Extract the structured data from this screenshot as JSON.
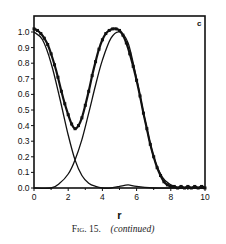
{
  "chart_data": {
    "type": "line",
    "panel_label": "c",
    "xlabel": "r",
    "ylabel": "",
    "xlim": [
      0,
      10
    ],
    "ylim": [
      0,
      1.1
    ],
    "xticks": [
      "0",
      "2",
      "4",
      "6",
      "8",
      "10"
    ],
    "yticks": [
      "0.0",
      "0.1",
      "0.2",
      "0.3",
      "0.4",
      "0.5",
      "0.6",
      "0.7",
      "0.8",
      "0.9",
      "1.0"
    ],
    "grid": false,
    "legend": null,
    "series": [
      {
        "name": "total (with markers)",
        "style": "line-markers",
        "x": [
          0,
          0.2,
          0.4,
          0.6,
          0.8,
          1.0,
          1.2,
          1.4,
          1.6,
          1.8,
          2.0,
          2.2,
          2.4,
          2.6,
          2.8,
          3.0,
          3.2,
          3.4,
          3.6,
          3.8,
          4.0,
          4.2,
          4.4,
          4.6,
          4.8,
          5.0,
          5.2,
          5.4,
          5.6,
          5.8,
          6.0,
          6.2,
          6.4,
          6.6,
          6.8,
          7.0,
          7.2,
          7.4,
          7.6,
          7.8,
          8.0,
          8.2,
          8.4,
          8.6,
          8.8,
          9.0,
          9.2,
          9.4,
          9.6,
          9.8,
          10.0
        ],
        "y": [
          1.02,
          1.01,
          0.99,
          0.96,
          0.92,
          0.86,
          0.79,
          0.71,
          0.62,
          0.54,
          0.47,
          0.41,
          0.38,
          0.4,
          0.45,
          0.53,
          0.62,
          0.72,
          0.81,
          0.89,
          0.95,
          0.99,
          1.01,
          1.02,
          1.02,
          1.01,
          0.98,
          0.93,
          0.86,
          0.78,
          0.69,
          0.59,
          0.48,
          0.38,
          0.28,
          0.2,
          0.13,
          0.08,
          0.04,
          0.02,
          0.01,
          0.01,
          0.0,
          0.01,
          0.0,
          0.01,
          0.0,
          0.01,
          0.0,
          0.01,
          0.0
        ]
      },
      {
        "name": "component 1",
        "style": "line",
        "x": [
          0,
          0.5,
          1.0,
          1.5,
          2.0,
          2.4,
          2.8,
          3.2,
          3.6,
          4.0,
          4.5,
          5.0,
          5.5,
          6.0,
          7.0,
          8.0,
          9.0,
          10.0
        ],
        "y": [
          1.0,
          0.95,
          0.8,
          0.58,
          0.34,
          0.18,
          0.08,
          0.03,
          0.01,
          0.0,
          0.0,
          0.01,
          0.02,
          0.01,
          0.0,
          0.0,
          0.0,
          0.0
        ]
      },
      {
        "name": "component 2",
        "style": "line",
        "x": [
          0,
          1.0,
          1.5,
          2.0,
          2.4,
          2.8,
          3.2,
          3.6,
          4.0,
          4.5,
          5.0,
          5.5,
          6.0,
          6.5,
          7.0,
          7.5,
          8.0,
          8.5,
          9.0,
          10.0
        ],
        "y": [
          0.0,
          0.0,
          0.03,
          0.09,
          0.18,
          0.31,
          0.48,
          0.66,
          0.82,
          0.96,
          1.0,
          0.93,
          0.7,
          0.43,
          0.2,
          0.07,
          0.02,
          0.0,
          0.0,
          0.0
        ]
      }
    ]
  },
  "caption": {
    "fig_label": "Fig. 15.",
    "text": "(continued)"
  }
}
